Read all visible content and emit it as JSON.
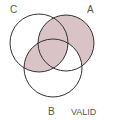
{
  "diagram": {
    "type": "venn-3",
    "labels": {
      "C": "C",
      "A": "A",
      "B": "B"
    },
    "verdict": "VALID",
    "shaded_regions": [
      "A only",
      "A∩C only",
      "A∩B∩C",
      "B∩C only"
    ],
    "unshaded_regions": [
      "C only",
      "B only",
      "A∩B only",
      "outside"
    ],
    "colors": {
      "shade": "#d9c3c6",
      "stroke": "#333333",
      "label": "#555555",
      "background": "#ffffff"
    }
  }
}
